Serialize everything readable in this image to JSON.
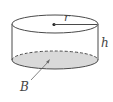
{
  "diagram": {
    "type": "cylinder",
    "labels": {
      "radius": "r",
      "height": "h",
      "base": "B"
    },
    "colors": {
      "stroke": "#4a4a4a",
      "base_fill": "#d9d9d9",
      "label": "#444444"
    }
  }
}
